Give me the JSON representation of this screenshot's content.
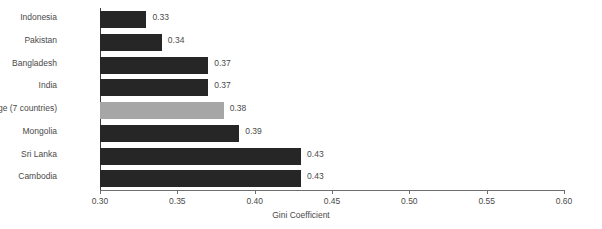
{
  "chart_data": {
    "type": "bar",
    "orientation": "horizontal",
    "title": "",
    "xlabel": "Gini Coefficient",
    "ylabel": "",
    "xlim": [
      0.3,
      0.6
    ],
    "xticks": [
      "0.30",
      "0.35",
      "0.40",
      "0.45",
      "0.50",
      "0.55",
      "0.60"
    ],
    "xtick_values": [
      0.3,
      0.35,
      0.4,
      0.45,
      0.5,
      0.55,
      0.6
    ],
    "grid": false,
    "legend": "none",
    "categories": [
      "Indonesia",
      "Pakistan",
      "Bangladesh",
      "India",
      "Average (7 countries)",
      "Mongolia",
      "Sri Lanka",
      "Cambodia"
    ],
    "values": [
      0.33,
      0.34,
      0.37,
      0.37,
      0.38,
      0.39,
      0.43,
      0.43
    ],
    "value_labels": [
      "0.33",
      "0.34",
      "0.37",
      "0.37",
      "0.38",
      "0.39",
      "0.43",
      "0.43"
    ],
    "highlight_index": 4,
    "colors": {
      "bar": "#262626",
      "bar_highlight": "#a6a6a6",
      "axis": "#6e6e6e",
      "text": "#4a4a4a",
      "background": "#ffffff"
    }
  }
}
